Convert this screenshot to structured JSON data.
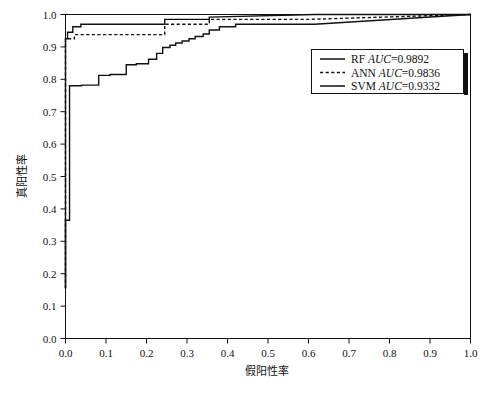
{
  "chart_data": {
    "type": "line",
    "title": "",
    "xlabel": "假阳性率",
    "ylabel": "真阳性率",
    "xlim": [
      0.0,
      1.0
    ],
    "ylim": [
      0.0,
      1.0
    ],
    "grid": false,
    "legend_position": "center-right",
    "xticks": [
      "0.0",
      "0.1",
      "0.2",
      "0.3",
      "0.4",
      "0.5",
      "0.6",
      "0.7",
      "0.8",
      "0.9",
      "1.0"
    ],
    "xtick_values": [
      0.0,
      0.1,
      0.2,
      0.3,
      0.4,
      0.5,
      0.6,
      0.7,
      0.8,
      0.9,
      1.0
    ],
    "yticks": [
      "0.0",
      "0.1",
      "0.2",
      "0.3",
      "0.4",
      "0.5",
      "0.6",
      "0.7",
      "0.8",
      "0.9",
      "1.0"
    ],
    "ytick_values": [
      0.0,
      0.1,
      0.2,
      0.3,
      0.4,
      0.5,
      0.6,
      0.7,
      0.8,
      0.9,
      1.0
    ],
    "series": [
      {
        "name": "RF",
        "auc": "0.9892",
        "legend_label": "RF",
        "legend_metric": "AUC=0.9892",
        "style": "solid",
        "color": "#111111",
        "x": [
          0.0,
          0.0,
          0.005,
          0.005,
          0.018,
          0.018,
          0.038,
          0.038,
          0.245,
          0.245,
          0.355,
          0.355,
          0.615,
          1.0
        ],
        "y": [
          0.155,
          0.925,
          0.925,
          0.945,
          0.945,
          0.962,
          0.962,
          0.97,
          0.97,
          0.985,
          0.985,
          0.992,
          1.0,
          1.0
        ]
      },
      {
        "name": "ANN",
        "auc": "0.9836",
        "legend_label": "ANN",
        "legend_metric": "AUC=0.9836",
        "style": "dashed",
        "color": "#111111",
        "x": [
          0.0,
          0.0,
          0.022,
          0.022,
          0.245,
          0.245,
          0.355,
          0.355,
          0.6,
          1.0
        ],
        "y": [
          0.155,
          0.925,
          0.925,
          0.938,
          0.938,
          0.97,
          0.97,
          0.985,
          0.985,
          1.0
        ]
      },
      {
        "name": "SVM",
        "auc": "0.9332",
        "legend_label": "SVM",
        "legend_metric": "AUC=0.9332",
        "style": "solid",
        "color": "#111111",
        "x": [
          0.0,
          0.0,
          0.01,
          0.01,
          0.04,
          0.04,
          0.082,
          0.082,
          0.11,
          0.11,
          0.15,
          0.15,
          0.175,
          0.175,
          0.205,
          0.205,
          0.225,
          0.225,
          0.24,
          0.24,
          0.258,
          0.258,
          0.272,
          0.272,
          0.288,
          0.288,
          0.305,
          0.305,
          0.32,
          0.32,
          0.34,
          0.34,
          0.355,
          0.355,
          0.38,
          0.38,
          0.42,
          0.42,
          0.615,
          1.0
        ],
        "y": [
          0.155,
          0.365,
          0.365,
          0.78,
          0.78,
          0.782,
          0.782,
          0.812,
          0.812,
          0.815,
          0.815,
          0.845,
          0.845,
          0.848,
          0.848,
          0.862,
          0.862,
          0.88,
          0.88,
          0.898,
          0.898,
          0.905,
          0.905,
          0.912,
          0.912,
          0.918,
          0.918,
          0.925,
          0.925,
          0.932,
          0.932,
          0.94,
          0.94,
          0.952,
          0.952,
          0.962,
          0.962,
          0.97,
          0.97,
          1.0
        ]
      }
    ],
    "legend_entries": [
      {
        "label": "RF",
        "metric": "AUC=0.9892",
        "style": "solid"
      },
      {
        "label": "ANN",
        "metric": "AUC=0.9836",
        "style": "dashed"
      },
      {
        "label": "SVM",
        "metric": "AUC=0.9332",
        "style": "solid"
      }
    ]
  }
}
